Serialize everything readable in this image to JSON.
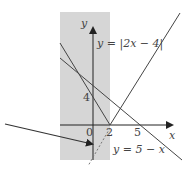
{
  "diagram": {
    "axes": {
      "x_label": "x",
      "y_label": "y",
      "origin_label": "0",
      "x_ticks": [
        "2",
        "5"
      ],
      "y_ticks": [
        "4"
      ]
    },
    "curves": [
      {
        "name": "abs",
        "label": "y = |2x − 4|"
      },
      {
        "name": "linear",
        "label": "y = 5 − x"
      }
    ],
    "colors": {
      "shade": "#d6d6d6",
      "line": "#444444",
      "axis": "#222222"
    }
  }
}
